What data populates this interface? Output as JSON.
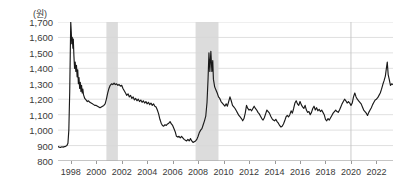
{
  "chart_data": {
    "type": "line",
    "title": "",
    "subtitle": "",
    "unit_label": "(원)",
    "xlabel": "",
    "ylabel": "",
    "ylim": [
      800,
      1700
    ],
    "xlim": [
      1997.0,
      2023.3
    ],
    "grid": true,
    "legend": false,
    "y_ticks": [
      800,
      900,
      1000,
      1100,
      1200,
      1300,
      1400,
      1500,
      1600,
      1700
    ],
    "y_tick_labels": [
      "800",
      "900",
      "1,000",
      "1,100",
      "1,200",
      "1,300",
      "1,400",
      "1,500",
      "1,600",
      "1,700"
    ],
    "x_ticks": [
      1998,
      2000,
      2002,
      2004,
      2006,
      2008,
      2010,
      2012,
      2014,
      2016,
      2018,
      2020,
      2022
    ],
    "x_tick_labels": [
      "1998",
      "2000",
      "2002",
      "2004",
      "2006",
      "2008",
      "2010",
      "2012",
      "2014",
      "2016",
      "2018",
      "2020",
      "2022"
    ],
    "line_color": "#1a1a1a",
    "grid_color": "#d8d8d8",
    "shade_color": "#dcdcdc",
    "shaded_regions": [
      {
        "x0": 2000.8,
        "x1": 2001.7,
        "label": "shaded-band-2001"
      },
      {
        "x0": 2007.8,
        "x1": 2009.6,
        "label": "shaded-band-2008"
      }
    ],
    "vertical_markers": [
      2020.0
    ],
    "series": [
      {
        "name": "USD/KRW exchange rate",
        "x": [
          1997.0,
          1997.1,
          1997.2,
          1997.3,
          1997.4,
          1997.5,
          1997.6,
          1997.7,
          1997.78,
          1997.85,
          1997.92,
          1998.0,
          1998.04,
          1998.08,
          1998.12,
          1998.17,
          1998.2,
          1998.25,
          1998.3,
          1998.35,
          1998.4,
          1998.45,
          1998.5,
          1998.55,
          1998.6,
          1998.65,
          1998.7,
          1998.75,
          1998.8,
          1998.85,
          1998.9,
          1998.95,
          1999.0,
          1999.1,
          1999.2,
          1999.3,
          1999.4,
          1999.5,
          1999.6,
          1999.7,
          1999.8,
          1999.9,
          2000.0,
          2000.1,
          2000.2,
          2000.3,
          2000.4,
          2000.5,
          2000.6,
          2000.7,
          2000.8,
          2000.9,
          2001.0,
          2001.1,
          2001.2,
          2001.3,
          2001.4,
          2001.5,
          2001.6,
          2001.7,
          2001.8,
          2001.9,
          2002.0,
          2002.1,
          2002.2,
          2002.3,
          2002.4,
          2002.5,
          2002.6,
          2002.7,
          2002.8,
          2002.9,
          2003.0,
          2003.1,
          2003.2,
          2003.3,
          2003.4,
          2003.5,
          2003.6,
          2003.7,
          2003.8,
          2003.9,
          2004.0,
          2004.1,
          2004.2,
          2004.3,
          2004.4,
          2004.5,
          2004.6,
          2004.7,
          2004.8,
          2004.9,
          2005.0,
          2005.1,
          2005.2,
          2005.3,
          2005.4,
          2005.5,
          2005.6,
          2005.7,
          2005.8,
          2005.9,
          2006.0,
          2006.1,
          2006.2,
          2006.3,
          2006.4,
          2006.5,
          2006.6,
          2006.7,
          2006.8,
          2006.9,
          2007.0,
          2007.1,
          2007.2,
          2007.3,
          2007.4,
          2007.5,
          2007.6,
          2007.7,
          2007.8,
          2007.9,
          2008.0,
          2008.1,
          2008.2,
          2008.3,
          2008.4,
          2008.5,
          2008.6,
          2008.7,
          2008.78,
          2008.85,
          2008.92,
          2009.0,
          2009.08,
          2009.15,
          2009.2,
          2009.3,
          2009.4,
          2009.5,
          2009.6,
          2009.7,
          2009.8,
          2009.9,
          2010.0,
          2010.1,
          2010.2,
          2010.3,
          2010.4,
          2010.5,
          2010.6,
          2010.7,
          2010.8,
          2010.9,
          2011.0,
          2011.1,
          2011.2,
          2011.3,
          2011.4,
          2011.5,
          2011.6,
          2011.7,
          2011.8,
          2011.9,
          2012.0,
          2012.1,
          2012.2,
          2012.3,
          2012.4,
          2012.5,
          2012.6,
          2012.7,
          2012.8,
          2012.9,
          2013.0,
          2013.1,
          2013.2,
          2013.3,
          2013.4,
          2013.5,
          2013.6,
          2013.7,
          2013.8,
          2013.9,
          2014.0,
          2014.1,
          2014.2,
          2014.3,
          2014.4,
          2014.5,
          2014.6,
          2014.7,
          2014.8,
          2014.9,
          2015.0,
          2015.1,
          2015.2,
          2015.3,
          2015.4,
          2015.5,
          2015.6,
          2015.7,
          2015.8,
          2015.9,
          2016.0,
          2016.1,
          2016.2,
          2016.3,
          2016.4,
          2016.5,
          2016.6,
          2016.7,
          2016.8,
          2016.9,
          2017.0,
          2017.1,
          2017.2,
          2017.3,
          2017.4,
          2017.5,
          2017.6,
          2017.7,
          2017.8,
          2017.9,
          2018.0,
          2018.1,
          2018.2,
          2018.3,
          2018.4,
          2018.5,
          2018.6,
          2018.7,
          2018.8,
          2018.9,
          2019.0,
          2019.1,
          2019.2,
          2019.3,
          2019.4,
          2019.5,
          2019.6,
          2019.7,
          2019.8,
          2019.9,
          2020.0,
          2020.1,
          2020.2,
          2020.3,
          2020.4,
          2020.5,
          2020.6,
          2020.7,
          2020.8,
          2020.9,
          2021.0,
          2021.1,
          2021.2,
          2021.3,
          2021.4,
          2021.5,
          2021.6,
          2021.7,
          2021.8,
          2021.9,
          2022.0,
          2022.1,
          2022.2,
          2022.3,
          2022.4,
          2022.5,
          2022.6,
          2022.7,
          2022.78,
          2022.85,
          2022.92,
          2023.0,
          2023.1,
          2023.2,
          2023.3
        ],
        "y": [
          893,
          890,
          888,
          892,
          890,
          893,
          895,
          900,
          915,
          1000,
          1250,
          1700,
          1640,
          1560,
          1600,
          1530,
          1590,
          1480,
          1400,
          1440,
          1380,
          1420,
          1345,
          1390,
          1300,
          1340,
          1270,
          1310,
          1250,
          1290,
          1240,
          1265,
          1230,
          1205,
          1195,
          1185,
          1190,
          1180,
          1175,
          1170,
          1165,
          1160,
          1160,
          1155,
          1150,
          1145,
          1150,
          1155,
          1160,
          1170,
          1200,
          1240,
          1270,
          1290,
          1300,
          1295,
          1305,
          1295,
          1300,
          1290,
          1295,
          1285,
          1290,
          1270,
          1255,
          1240,
          1225,
          1235,
          1215,
          1225,
          1205,
          1215,
          1195,
          1205,
          1190,
          1200,
          1185,
          1195,
          1180,
          1190,
          1175,
          1185,
          1170,
          1180,
          1165,
          1175,
          1160,
          1170,
          1155,
          1150,
          1130,
          1105,
          1070,
          1045,
          1030,
          1025,
          1035,
          1030,
          1040,
          1045,
          1055,
          1040,
          1030,
          1010,
          990,
          960,
          955,
          960,
          950,
          960,
          950,
          940,
          935,
          930,
          940,
          930,
          945,
          930,
          920,
          925,
          930,
          940,
          960,
          985,
          1000,
          1010,
          1035,
          1060,
          1090,
          1180,
          1330,
          1500,
          1380,
          1510,
          1380,
          1450,
          1330,
          1280,
          1260,
          1240,
          1215,
          1205,
          1185,
          1175,
          1165,
          1155,
          1170,
          1155,
          1185,
          1215,
          1190,
          1160,
          1150,
          1140,
          1125,
          1110,
          1095,
          1085,
          1075,
          1060,
          1075,
          1110,
          1160,
          1140,
          1130,
          1135,
          1125,
          1140,
          1155,
          1140,
          1130,
          1115,
          1105,
          1090,
          1075,
          1065,
          1080,
          1105,
          1130,
          1120,
          1110,
          1090,
          1075,
          1065,
          1060,
          1070,
          1055,
          1045,
          1030,
          1020,
          1025,
          1040,
          1060,
          1085,
          1095,
          1085,
          1100,
          1125,
          1110,
          1140,
          1175,
          1190,
          1170,
          1160,
          1185,
          1165,
          1150,
          1140,
          1160,
          1130,
          1115,
          1120,
          1100,
          1115,
          1140,
          1155,
          1130,
          1145,
          1125,
          1135,
          1120,
          1130,
          1115,
          1100,
          1070,
          1060,
          1075,
          1065,
          1080,
          1095,
          1110,
          1120,
          1130,
          1120,
          1115,
          1130,
          1150,
          1170,
          1185,
          1200,
          1190,
          1175,
          1185,
          1175,
          1160,
          1175,
          1215,
          1240,
          1215,
          1200,
          1190,
          1180,
          1170,
          1150,
          1130,
          1120,
          1110,
          1095,
          1115,
          1130,
          1145,
          1165,
          1180,
          1195,
          1200,
          1210,
          1225,
          1240,
          1265,
          1295,
          1320,
          1350,
          1400,
          1440,
          1360,
          1330,
          1290,
          1300,
          1295
        ]
      }
    ]
  }
}
